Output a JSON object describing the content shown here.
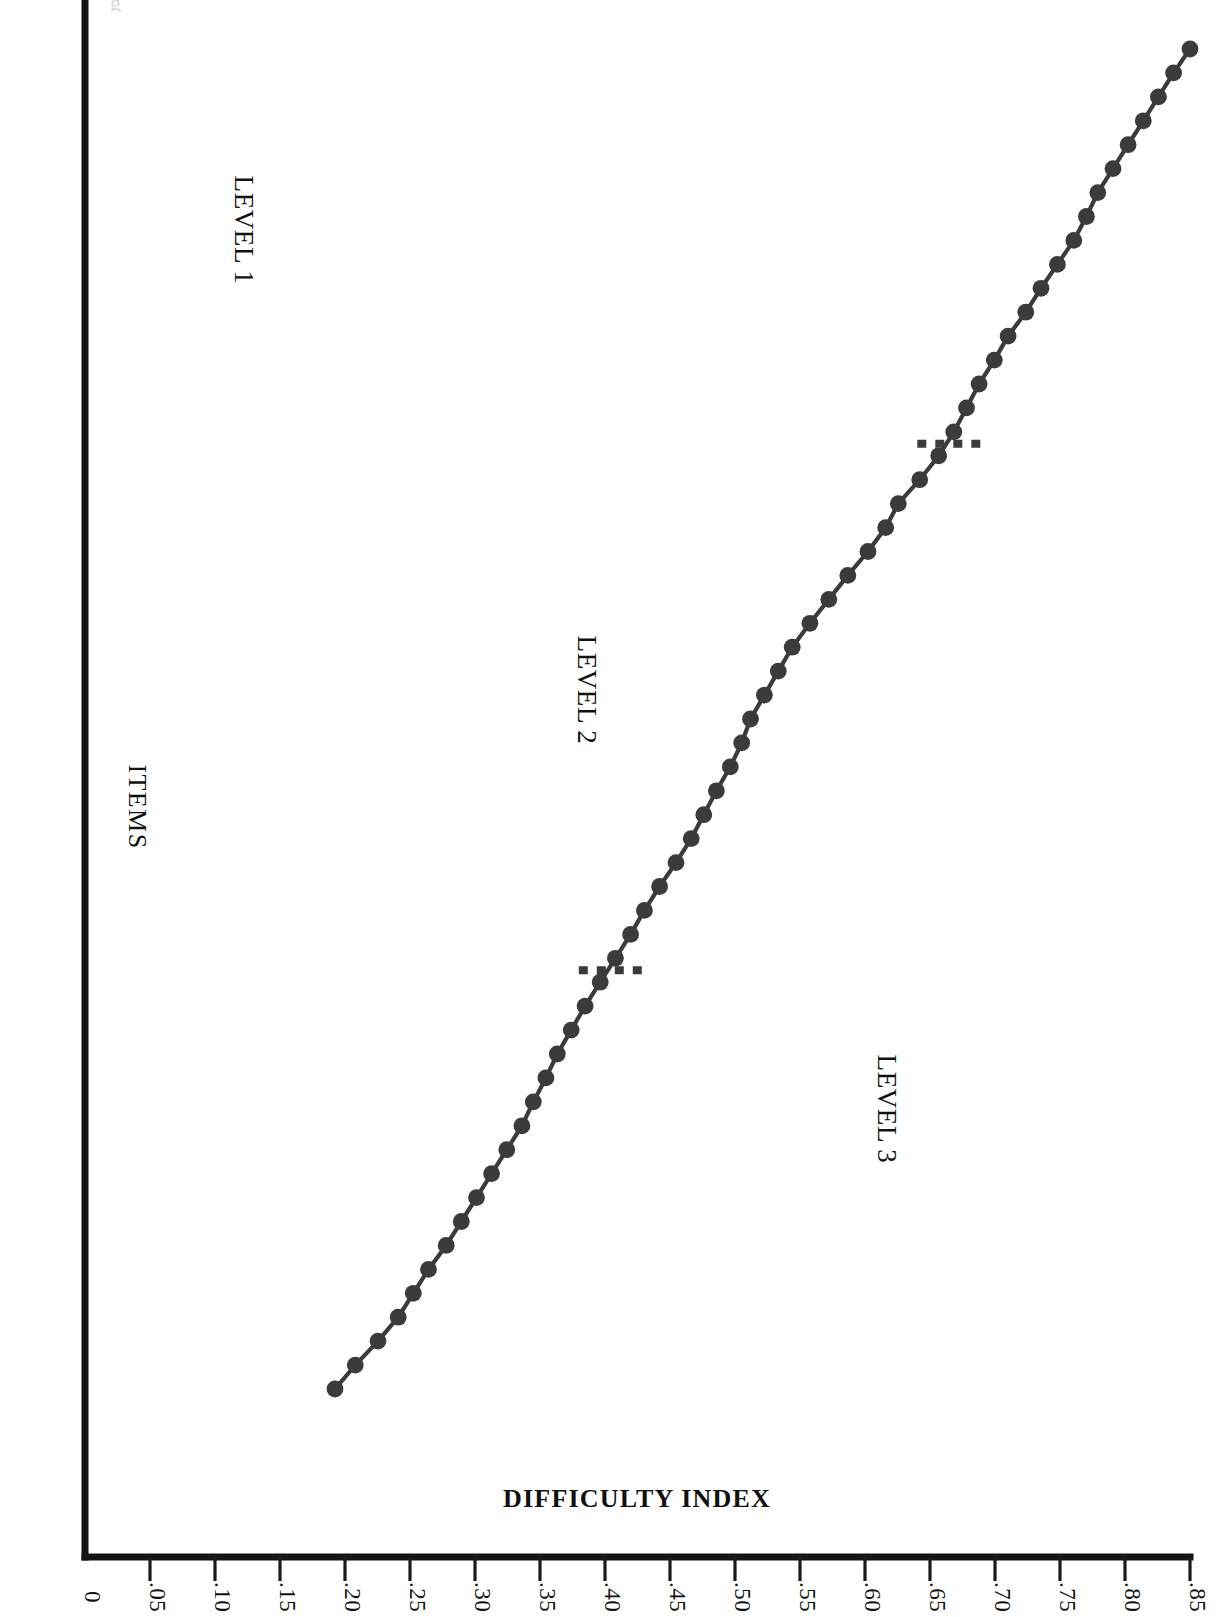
{
  "figure": {
    "orientation": "rotated-180",
    "background_color": "#ffffff",
    "ink_color": "#3b3b3b",
    "axis_color": "#141414",
    "scan_artifact": "g"
  },
  "chart_data": {
    "type": "line",
    "title": "",
    "subtitle": "",
    "xlabel": "ITEMS",
    "ylabel": "DIFFICULTY INDEX",
    "grid": false,
    "legend": "none",
    "marker": "filled-circle",
    "ylim": [
      0,
      0.875
    ],
    "yticks": [
      0.85,
      0.8,
      0.75,
      0.7,
      0.65,
      0.6,
      0.55,
      0.5,
      0.45,
      0.4,
      0.35,
      0.3,
      0.25,
      0.2,
      0.15,
      0.1,
      0.05,
      0
    ],
    "ytick_labels": [
      ".85",
      ".80",
      ".75",
      ".70",
      ".65",
      ".60",
      ".55",
      ".50",
      ".45",
      ".40",
      ".35",
      ".30",
      ".25",
      ".20",
      ".15",
      ".10",
      ".05",
      "0"
    ],
    "xticks": [],
    "xtick_labels": [],
    "x_axis_note": "items ordered by decreasing difficulty index; no numeric item labels printed",
    "series": [
      {
        "name": "Difficulty index by item",
        "x": [
          1,
          2,
          3,
          4,
          5,
          6,
          7,
          8,
          9,
          10,
          11,
          12,
          13,
          14,
          15,
          16,
          17,
          18,
          19,
          20,
          21,
          22,
          23,
          24,
          25,
          26,
          27,
          28,
          29,
          30,
          31,
          32,
          33,
          34,
          35,
          36,
          37,
          38,
          39,
          40,
          41,
          42,
          43,
          44,
          45,
          46,
          47,
          48,
          49,
          50,
          51,
          52,
          53,
          54,
          55,
          56,
          57
        ],
        "values": [
          0.875,
          0.862,
          0.85,
          0.838,
          0.826,
          0.814,
          0.802,
          0.793,
          0.783,
          0.77,
          0.757,
          0.745,
          0.731,
          0.72,
          0.708,
          0.698,
          0.688,
          0.676,
          0.661,
          0.644,
          0.634,
          0.62,
          0.604,
          0.589,
          0.574,
          0.56,
          0.549,
          0.538,
          0.527,
          0.52,
          0.511,
          0.5,
          0.49,
          0.48,
          0.468,
          0.455,
          0.443,
          0.432,
          0.42,
          0.408,
          0.396,
          0.385,
          0.374,
          0.365,
          0.355,
          0.346,
          0.334,
          0.322,
          0.31,
          0.298,
          0.286,
          0.272,
          0.26,
          0.248,
          0.232,
          0.214,
          0.198
        ]
      }
    ],
    "annotations": [
      {
        "id": "level-1",
        "label": "LEVEL 1",
        "kind": "group-label"
      },
      {
        "id": "level-2",
        "label": "LEVEL 2",
        "kind": "group-label"
      },
      {
        "id": "level-3",
        "label": "LEVEL 3",
        "kind": "group-label"
      },
      {
        "id": "cut-1",
        "label": "",
        "kind": "dashed-divider",
        "between_items": [
          17,
          18
        ],
        "at_difficulty": 0.682
      },
      {
        "id": "cut-2",
        "label": "",
        "kind": "dashed-divider",
        "between_items": [
          39,
          40
        ],
        "at_difficulty": 0.414
      }
    ],
    "groups": [
      {
        "label": "LEVEL 1",
        "item_range": [
          1,
          17
        ],
        "difficulty_range": [
          0.688,
          0.875
        ]
      },
      {
        "label": "LEVEL 2",
        "item_range": [
          18,
          39
        ],
        "difficulty_range": [
          0.42,
          0.676
        ]
      },
      {
        "label": "LEVEL 3",
        "item_range": [
          40,
          57
        ],
        "difficulty_range": [
          0.198,
          0.408
        ]
      }
    ]
  },
  "labels": {
    "y_axis_title": "DIFFICULTY INDEX",
    "x_axis_title": "ITEMS",
    "level_1": "LEVEL 1",
    "level_2": "LEVEL 2",
    "level_3": "LEVEL 3",
    "ticks": {
      "t85": ".85",
      "t80": ".80",
      "t75": ".75",
      "t70": ".70",
      "t65": ".65",
      "t60": ".60",
      "t55": ".55",
      "t50": ".50",
      "t45": ".45",
      "t40": ".40",
      "t35": ".35",
      "t30": ".30",
      "t25": ".25",
      "t20": ".20",
      "t15": ".15",
      "t10": ".10",
      "t05": ".05",
      "t0": "0"
    }
  }
}
